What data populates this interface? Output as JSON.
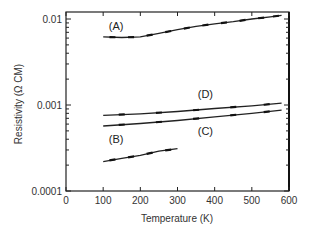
{
  "chart_data": {
    "type": "line",
    "title": "",
    "xlabel": "Temperature (K)",
    "ylabel": "Resistivity (Ω CM)",
    "xlim": [
      0,
      600
    ],
    "ylim": [
      0.0001,
      0.012
    ],
    "yscale": "log",
    "xticks": [
      0,
      100,
      200,
      300,
      400,
      500,
      600
    ],
    "yticks": [
      0.0001,
      0.001,
      0.01
    ],
    "ytick_labels": [
      "0.0001",
      "0.001",
      "0.01"
    ],
    "grid": false,
    "legend": "inline labels",
    "series": [
      {
        "name": "(A)",
        "x": [
          100,
          150,
          200,
          250,
          300,
          350,
          400,
          450,
          500,
          550,
          580
        ],
        "values": [
          0.0062,
          0.0061,
          0.0062,
          0.0068,
          0.0075,
          0.0082,
          0.0088,
          0.0093,
          0.01,
          0.0106,
          0.011
        ]
      },
      {
        "name": "(B)",
        "x": [
          100,
          150,
          200,
          250,
          300
        ],
        "values": [
          0.00022,
          0.00024,
          0.00026,
          0.00029,
          0.00031
        ]
      },
      {
        "name": "(C)",
        "x": [
          100,
          200,
          300,
          400,
          500,
          580
        ],
        "values": [
          0.00057,
          0.00061,
          0.00066,
          0.00073,
          0.0008,
          0.00087
        ]
      },
      {
        "name": "(D)",
        "x": [
          100,
          200,
          300,
          400,
          500,
          580
        ],
        "values": [
          0.00076,
          0.00079,
          0.00084,
          0.00091,
          0.00098,
          0.00105
        ]
      }
    ],
    "annotations": [
      {
        "text": "(A)",
        "x": 135,
        "y": 0.0075
      },
      {
        "text": "(B)",
        "x": 135,
        "y": 0.00036
      },
      {
        "text": "(C)",
        "x": 375,
        "y": 0.00045
      },
      {
        "text": "(D)",
        "x": 375,
        "y": 0.0012
      }
    ]
  }
}
